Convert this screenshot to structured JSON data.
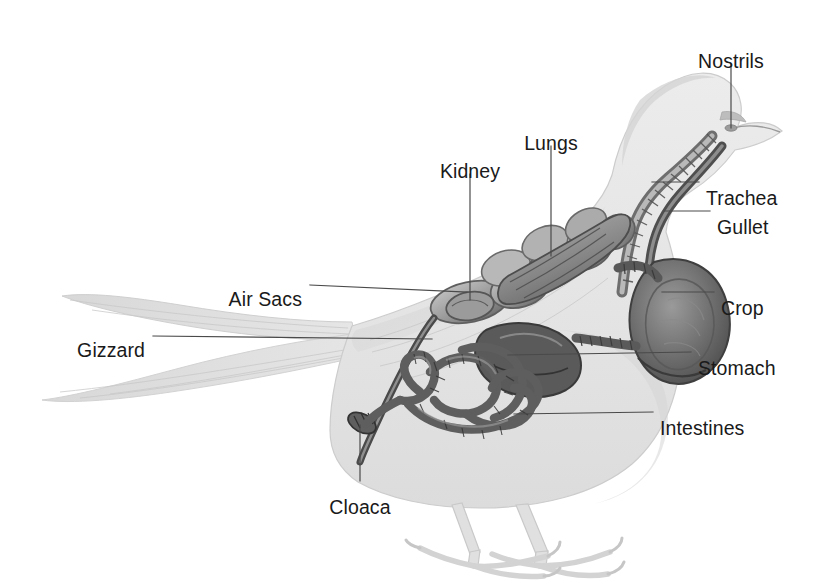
{
  "diagram": {
    "view": "lateral cutaway",
    "background_color": "#ffffff",
    "label_color": "#1a1a1a",
    "leader_color": "#4a4a4a",
    "body_fill": "#e6e6e6",
    "body_stroke": "#cfcfcf",
    "organ_dark": "#5c5c5c",
    "organ_mid": "#8a8a8a",
    "organ_light": "#b5b5b5"
  },
  "labels": [
    {
      "id": "nostrils",
      "text": "Nostrils",
      "text_x": 731,
      "text_y": 52,
      "align": "mid",
      "leader": [
        [
          731,
          64
        ],
        [
          731,
          128
        ]
      ]
    },
    {
      "id": "lungs",
      "text": "Lungs",
      "text_x": 551,
      "text_y": 134,
      "align": "mid",
      "leader": [
        [
          551,
          146
        ],
        [
          551,
          256
        ]
      ]
    },
    {
      "id": "kidney",
      "text": "Kidney",
      "text_x": 470,
      "text_y": 162,
      "align": "mid",
      "leader": [
        [
          470,
          174
        ],
        [
          470,
          300
        ]
      ]
    },
    {
      "id": "trachea",
      "text": "Trachea",
      "text_x": 706,
      "text_y": 189,
      "align": "start",
      "leader": [
        [
          699,
          182
        ],
        [
          652,
          182
        ]
      ]
    },
    {
      "id": "gullet",
      "text": "Gullet",
      "text_x": 717,
      "text_y": 218,
      "align": "start",
      "leader": [
        [
          710,
          211
        ],
        [
          664,
          211
        ]
      ]
    },
    {
      "id": "air-sacs",
      "text": "Air Sacs",
      "text_x": 302,
      "text_y": 290,
      "align": "end",
      "leader": [
        [
          310,
          285
        ],
        [
          467,
          292
        ]
      ]
    },
    {
      "id": "crop",
      "text": "Crop",
      "text_x": 721,
      "text_y": 299,
      "align": "start",
      "leader": [
        [
          714,
          292
        ],
        [
          662,
          292
        ]
      ]
    },
    {
      "id": "gizzard",
      "text": "Gizzard",
      "text_x": 145,
      "text_y": 341,
      "align": "end",
      "leader": [
        [
          153,
          336
        ],
        [
          432,
          339
        ]
      ]
    },
    {
      "id": "stomach",
      "text": "Stomach",
      "text_x": 698,
      "text_y": 359,
      "align": "start",
      "leader": [
        [
          691,
          352
        ],
        [
          508,
          355
        ]
      ]
    },
    {
      "id": "intestines",
      "text": "Intestines",
      "text_x": 660,
      "text_y": 419,
      "align": "start",
      "leader": [
        [
          653,
          412
        ],
        [
          514,
          414
        ]
      ]
    },
    {
      "id": "cloaca",
      "text": "Cloaca",
      "text_x": 360,
      "text_y": 498,
      "align": "mid",
      "leader": [
        [
          360,
          481
        ],
        [
          360,
          425
        ]
      ]
    }
  ]
}
